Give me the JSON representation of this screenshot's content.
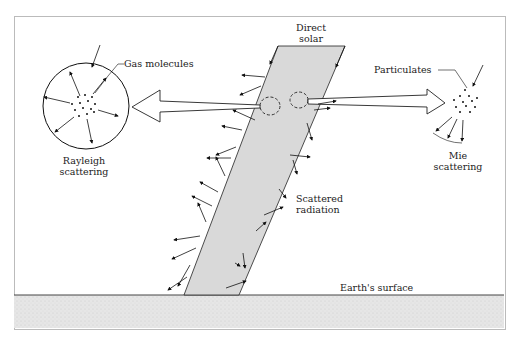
{
  "diagram": {
    "labels": {
      "direct_solar": "Direct\nsolar",
      "gas_molecules": "Gas molecules",
      "rayleigh": "Rayleigh\nscattering",
      "particulates": "Particulates",
      "mie": "Mie\nscattering",
      "scattered_radiation": "Scattered\nradiation",
      "earth_surface": "Earth's surface"
    },
    "colors": {
      "beam_fill": "#d9d9d9",
      "ground_fill": "#e4e4e4",
      "line": "#111111"
    }
  }
}
